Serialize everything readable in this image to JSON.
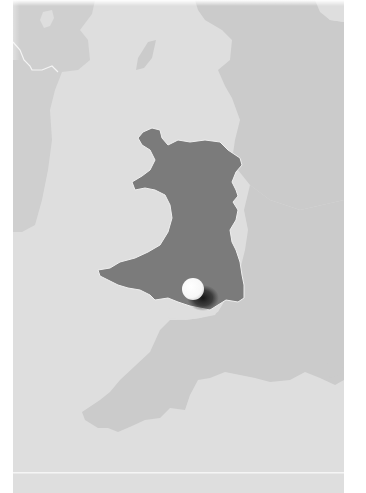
{
  "map": {
    "subject": "Wales locator map",
    "highlighted_region": "Wales",
    "marker": {
      "label": "",
      "x": 193,
      "y": 289,
      "radius": 11
    },
    "colors": {
      "sea": "#dedede",
      "land": "#cbcbcb",
      "ireland": "#cfcfcf",
      "highlight": "#7b7b7b",
      "marker": "#ffffff",
      "marker_shadow": "#1e1e1e",
      "border_line": "#f2f2f2"
    }
  }
}
